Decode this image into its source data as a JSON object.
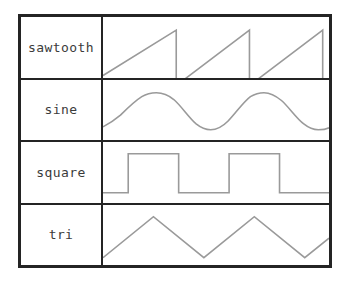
{
  "table": {
    "border_color": "#242424",
    "background_color": "#ffffff",
    "wave_color": "#9a9a9a",
    "label_color": "#3b3b3b",
    "rows": [
      {
        "label": "sawtooth",
        "wave_type": "sawtooth",
        "cycles": 2.85,
        "phase": 0.15,
        "amplitude": 1,
        "path": "M 0,58 L 75.5,13 L 75.5,68 L 151,13 L 151,68 L 226.5,13 L 226.5,68 L 233,64"
      },
      {
        "label": "sine",
        "wave_type": "sine",
        "cycles": 2.35,
        "phase": 0.82,
        "amplitude": 1,
        "path": "M 0,48 C 6,45 12,41 18,36 C 25,29 32,22 40,17 C 45,14 50,13 55,13 C 61,13 67,15 73,20 C 81,27 88,38 96,45 C 101,49 106,51 111,51 C 117,51 123,48 129,42 C 137,34 144,23 152,17 C 157,14 161,13 166,13 C 172,13 178,16 184,21 C 192,28 199,39 207,45 C 212,49 217,51 222,51 C 227,51 231,50 233,49"
      },
      {
        "label": "square",
        "wave_type": "square",
        "cycles": 2.3,
        "phase": 0.1,
        "amplitude": 1,
        "duty_cycle": 0.5,
        "path": "M 0,52 L 26,52 L 26,12 L 78,12 L 78,52 L 130,52 L 130,12 L 182,12 L 182,52 L 233,52"
      },
      {
        "label": "tri",
        "wave_type": "triangle",
        "cycles": 2.3,
        "phase": 0.12,
        "amplitude": 1,
        "path": "M 0,54 L 52,12 L 104,54 L 156,12 L 208,54 L 233,34"
      }
    ]
  }
}
